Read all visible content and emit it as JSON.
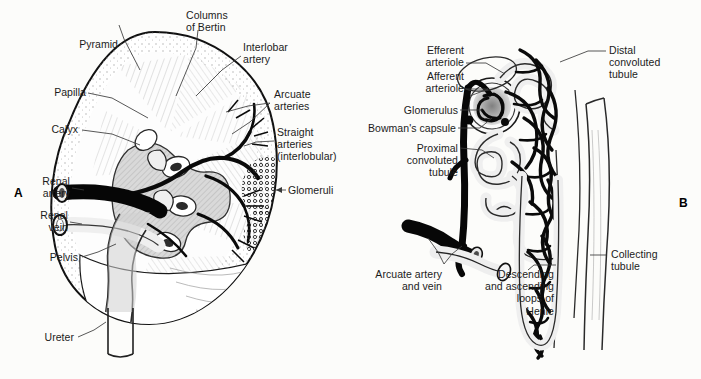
{
  "figure": {
    "background_color": "#fcfcfa",
    "ink_color": "#1b1b1b",
    "panels": [
      {
        "id": "A",
        "label": "A",
        "caption": "Coronal section of the kidney"
      },
      {
        "id": "B",
        "label": "B",
        "caption": "Nephron and its blood supply"
      }
    ]
  },
  "panel_a": {
    "label": "A",
    "labels": [
      {
        "key": "pyramid",
        "text": "Pyramid",
        "align": "right"
      },
      {
        "key": "columns_of_bertin",
        "text": "Columns\nof Bertin",
        "align": "left"
      },
      {
        "key": "interlobar_artery",
        "text": "Interlobar\nartery",
        "align": "left"
      },
      {
        "key": "papilla",
        "text": "Papilla",
        "align": "right"
      },
      {
        "key": "arcuate_arteries",
        "text": "Arcuate\narteries",
        "align": "left"
      },
      {
        "key": "calyx",
        "text": "Calyx",
        "align": "right"
      },
      {
        "key": "straight_arteries",
        "text": "Straight\narteries\n(interlobular)",
        "align": "left"
      },
      {
        "key": "renal_artery",
        "text": "Renal\nartery",
        "align": "right"
      },
      {
        "key": "glomeruli",
        "text": "Glomeruli",
        "align": "left"
      },
      {
        "key": "renal_vein",
        "text": "Renal\nvein",
        "align": "right"
      },
      {
        "key": "pelvis",
        "text": "Pelvis",
        "align": "right"
      },
      {
        "key": "ureter",
        "text": "Ureter",
        "align": "right"
      }
    ]
  },
  "panel_b": {
    "label": "B",
    "labels": [
      {
        "key": "efferent_arteriole",
        "text": "Efferent\narteriole",
        "align": "right"
      },
      {
        "key": "distal_tubule",
        "text": "Distal\nconvoluted\ntubule",
        "align": "left"
      },
      {
        "key": "afferent_arteriole",
        "text": "Afferent\narteriole",
        "align": "right"
      },
      {
        "key": "glomerulus",
        "text": "Glomerulus",
        "align": "right"
      },
      {
        "key": "bowmans_capsule",
        "text": "Bowman's capsule",
        "align": "right"
      },
      {
        "key": "proximal_tubule",
        "text": "Proximal\nconvoluted\ntubule",
        "align": "right"
      },
      {
        "key": "collecting_tubule",
        "text": "Collecting\ntubule",
        "align": "left"
      },
      {
        "key": "arcuate_artery_vein",
        "text": "Arcuate artery\nand vein",
        "align": "right"
      },
      {
        "key": "loops_of_henle",
        "text": "Descending\nand ascending\nloops of\nHenle",
        "align": "right"
      }
    ]
  }
}
